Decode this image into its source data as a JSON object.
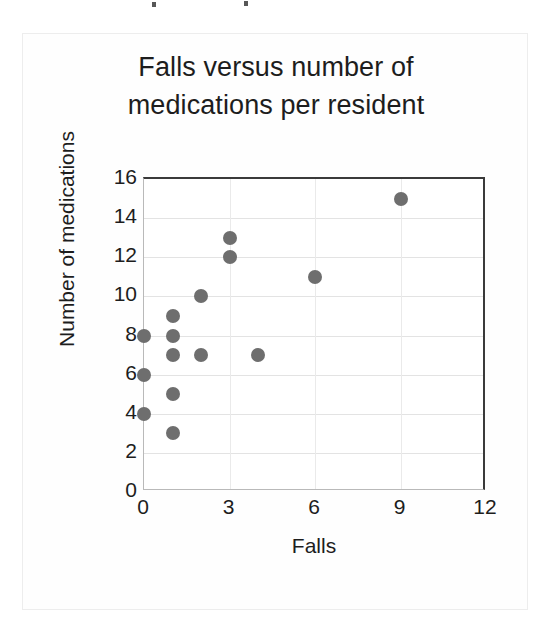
{
  "chart_data": {
    "type": "scatter",
    "title": "Falls versus number of medications per resident",
    "title_lines": [
      "Falls versus number of",
      "medications per resident"
    ],
    "xlabel": "Falls",
    "ylabel": "Number of medications",
    "xlim": [
      0,
      12
    ],
    "ylim": [
      0,
      16
    ],
    "x_ticks": [
      0,
      3,
      6,
      9,
      12
    ],
    "y_ticks": [
      0,
      2,
      4,
      6,
      8,
      10,
      12,
      14,
      16
    ],
    "x_tick_labels": [
      "0",
      "3",
      "6",
      "9",
      "12"
    ],
    "y_tick_labels": [
      "0",
      "2",
      "4",
      "6",
      "8",
      "10",
      "12",
      "14",
      "16"
    ],
    "grid": true,
    "legend": "none",
    "marker": {
      "shape": "circle",
      "color": "#6e6e6e",
      "size_px": 14
    },
    "points": [
      {
        "x": 0,
        "y": 8
      },
      {
        "x": 0,
        "y": 6
      },
      {
        "x": 0,
        "y": 4
      },
      {
        "x": 1,
        "y": 9
      },
      {
        "x": 1,
        "y": 8
      },
      {
        "x": 1,
        "y": 7
      },
      {
        "x": 1,
        "y": 5
      },
      {
        "x": 1,
        "y": 3
      },
      {
        "x": 2,
        "y": 10
      },
      {
        "x": 2,
        "y": 7
      },
      {
        "x": 3,
        "y": 13
      },
      {
        "x": 3,
        "y": 12
      },
      {
        "x": 4,
        "y": 7
      },
      {
        "x": 6,
        "y": 11
      },
      {
        "x": 9,
        "y": 15
      }
    ]
  }
}
